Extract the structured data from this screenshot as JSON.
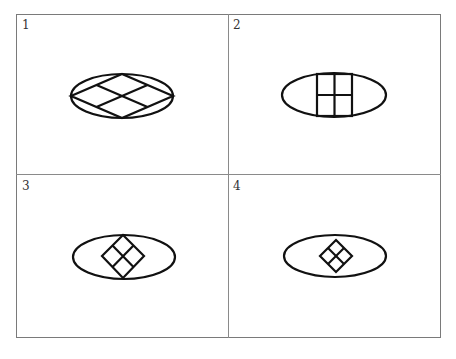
{
  "panels": [
    {
      "label": "1",
      "description": "Ellipse with inscribed rhombus subdivided into four rhombi, rhombus vertices touching ellipse at all four extremes"
    },
    {
      "label": "2",
      "description": "Ellipse with inscribed square subdivided into four squares, square touching ellipse top and bottom"
    },
    {
      "label": "3",
      "description": "Ellipse with rotated square (diamond) subdivided into four, touching ellipse top and bottom"
    },
    {
      "label": "4",
      "description": "Ellipse with small rotated square (diamond) subdivided into four, not touching ellipse"
    }
  ],
  "colors": {
    "stroke": "#111111",
    "grid": "#7a7a7a",
    "background": "#ffffff"
  }
}
